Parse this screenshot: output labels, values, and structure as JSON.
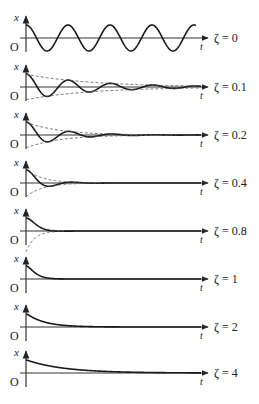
{
  "figure": {
    "axis_labels": {
      "y": "x",
      "x": "t",
      "origin": "O"
    },
    "panels": [
      {
        "zeta_label": "ζ = 0",
        "zeta": 0,
        "axis_y": 38,
        "type": "undamped"
      },
      {
        "zeta_label": "ζ = 0.1",
        "zeta": 0.1,
        "axis_y": 87,
        "type": "underdamped"
      },
      {
        "zeta_label": "ζ = 0.2",
        "zeta": 0.2,
        "axis_y": 135,
        "type": "underdamped"
      },
      {
        "zeta_label": "ζ = 0.4",
        "zeta": 0.4,
        "axis_y": 183,
        "type": "underdamped"
      },
      {
        "zeta_label": "ζ = 0.8",
        "zeta": 0.8,
        "axis_y": 231,
        "type": "underdamped"
      },
      {
        "zeta_label": "ζ = 1",
        "zeta": 1,
        "axis_y": 279,
        "type": "critically-damped"
      },
      {
        "zeta_label": "ζ = 2",
        "zeta": 2,
        "axis_y": 327,
        "type": "overdamped"
      },
      {
        "zeta_label": "ζ = 4",
        "zeta": 4,
        "axis_y": 373,
        "type": "overdamped"
      }
    ],
    "colors": {
      "curve": "#1a1a1a",
      "axis": "#333333",
      "envelope": "#555555"
    }
  }
}
